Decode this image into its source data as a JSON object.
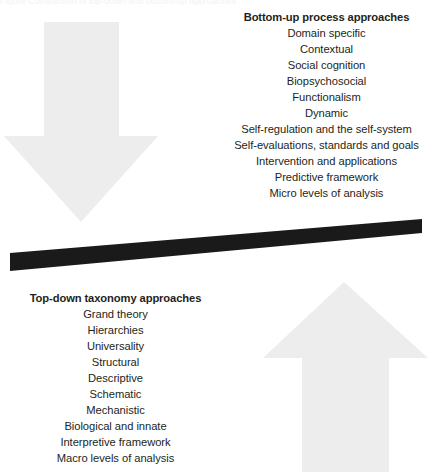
{
  "figure": {
    "top_caption_fragment": "Figure   Comparison of top-down and bottom-up approaches",
    "colors": {
      "arrow_fill": "#ededed",
      "beam_fill": "#1a1a1a",
      "text": "#231f20",
      "background": "#ffffff"
    }
  },
  "bottom_up": {
    "heading": "Bottom-up process approaches",
    "items": [
      "Domain specific",
      "Contextual",
      "Social cognition",
      "Biopsychosocial",
      "Functionalism",
      "Dynamic",
      "Self-regulation and the self-system",
      "Self-evaluations, standards and goals",
      "Intervention and applications",
      "Predictive framework",
      "Micro levels of analysis"
    ]
  },
  "top_down": {
    "heading": "Top-down taxonomy approaches",
    "items": [
      "Grand theory",
      "Hierarchies",
      "Universality",
      "Structural",
      "Descriptive",
      "Schematic",
      "Mechanistic",
      "Biological and innate",
      "Interpretive framework",
      "Macro levels of analysis"
    ]
  },
  "arrows": {
    "down_arrow_name": "down-arrow",
    "up_arrow_name": "up-arrow"
  },
  "beam": {
    "name": "balance-beam"
  }
}
